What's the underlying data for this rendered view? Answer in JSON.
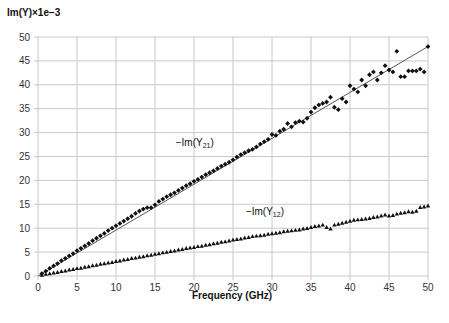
{
  "chart_data": {
    "type": "scatter",
    "title": "",
    "ylabel": "Im(Y)×1e−3",
    "xlabel": "Frequency (GHz)",
    "xlim": [
      0,
      50
    ],
    "ylim": [
      0,
      50
    ],
    "xticks": [
      0,
      5,
      10,
      15,
      20,
      25,
      30,
      35,
      40,
      45,
      50
    ],
    "yticks": [
      0,
      5,
      10,
      15,
      20,
      25,
      30,
      35,
      40,
      45,
      50
    ],
    "grid": true,
    "legend": "none",
    "series": [
      {
        "name": "−Im(Y21)",
        "label_main": "−Im(Y",
        "label_sub": "21",
        "label_close": ")",
        "marker": "diamond",
        "color": "#111111",
        "x": [
          0.5,
          1,
          1.5,
          2,
          2.5,
          3,
          3.5,
          4,
          4.5,
          5,
          5.5,
          6,
          6.5,
          7,
          7.5,
          8,
          8.5,
          9,
          9.5,
          10,
          10.5,
          11,
          11.5,
          12,
          12.5,
          13,
          13.5,
          14,
          14.5,
          15,
          15.5,
          16,
          16.5,
          17,
          17.5,
          18,
          18.5,
          19,
          19.5,
          20,
          20.5,
          21,
          21.5,
          22,
          22.5,
          23,
          23.5,
          24,
          24.5,
          25,
          25.5,
          26,
          26.5,
          27,
          27.5,
          28,
          28.5,
          29,
          29.5,
          30,
          30.5,
          31,
          31.5,
          32,
          32.5,
          33,
          33.5,
          34,
          34.5,
          35,
          35.5,
          36,
          36.5,
          37,
          37.5,
          38,
          38.5,
          39,
          39.5,
          40,
          40.5,
          41,
          41.5,
          42,
          42.5,
          43,
          43.5,
          44,
          44.5,
          45,
          45.5,
          46,
          46.5,
          47,
          47.5,
          48,
          48.5,
          49,
          49.5,
          50
        ],
        "y": [
          0.5,
          1.0,
          1.6,
          2.1,
          2.6,
          3.2,
          3.7,
          4.2,
          4.7,
          5.3,
          5.8,
          6.3,
          6.8,
          7.4,
          7.9,
          8.4,
          8.9,
          9.5,
          10.0,
          10.5,
          11.0,
          11.5,
          12.0,
          12.5,
          13.1,
          13.6,
          14.0,
          14.3,
          14.3,
          14.9,
          15.6,
          16.1,
          16.6,
          17.0,
          17.4,
          17.9,
          18.4,
          18.9,
          19.3,
          19.8,
          20.2,
          20.7,
          21.2,
          21.6,
          22.0,
          22.5,
          23.0,
          23.4,
          23.8,
          24.3,
          24.9,
          25.4,
          25.8,
          26.2,
          26.5,
          27.0,
          27.6,
          28.1,
          28.6,
          29.6,
          29.4,
          30.3,
          30.7,
          31.9,
          31.2,
          32.1,
          32.4,
          32.2,
          33.0,
          34.3,
          35.2,
          35.8,
          36.1,
          36.4,
          37.4,
          35.3,
          34.8,
          37.1,
          36.4,
          39.8,
          39.1,
          38.5,
          41.0,
          39.8,
          42.1,
          42.7,
          41.0,
          42.5,
          44.0,
          43.1,
          42.7,
          47.0,
          41.7,
          41.7,
          42.9,
          42.9,
          42.9,
          43.3,
          42.7,
          48.0
        ]
      },
      {
        "name": "−Im(Y12)",
        "label_main": "−Im(Y",
        "label_sub": "12",
        "label_close": ")",
        "marker": "triangle",
        "color": "#111111",
        "x": [
          0.5,
          1,
          1.5,
          2,
          2.5,
          3,
          3.5,
          4,
          4.5,
          5,
          5.5,
          6,
          6.5,
          7,
          7.5,
          8,
          8.5,
          9,
          9.5,
          10,
          10.5,
          11,
          11.5,
          12,
          12.5,
          13,
          13.5,
          14,
          14.5,
          15,
          15.5,
          16,
          16.5,
          17,
          17.5,
          18,
          18.5,
          19,
          19.5,
          20,
          20.5,
          21,
          21.5,
          22,
          22.5,
          23,
          23.5,
          24,
          24.5,
          25,
          25.5,
          26,
          26.5,
          27,
          27.5,
          28,
          28.5,
          29,
          29.5,
          30,
          30.5,
          31,
          31.5,
          32,
          32.5,
          33,
          33.5,
          34,
          34.5,
          35,
          35.5,
          36,
          36.5,
          37,
          37.5,
          38,
          38.5,
          39,
          39.5,
          40,
          40.5,
          41,
          41.5,
          42,
          42.5,
          43,
          43.5,
          44,
          44.5,
          45,
          45.5,
          46,
          46.5,
          47,
          47.5,
          48,
          48.5,
          49,
          49.5,
          50
        ],
        "y": [
          0.2,
          0.4,
          0.5,
          0.7,
          0.8,
          1.0,
          1.1,
          1.3,
          1.4,
          1.6,
          1.7,
          1.9,
          2.0,
          2.2,
          2.3,
          2.5,
          2.6,
          2.8,
          2.9,
          3.1,
          3.2,
          3.4,
          3.5,
          3.7,
          3.8,
          4.0,
          4.1,
          4.3,
          4.4,
          4.6,
          4.7,
          4.9,
          5.0,
          5.2,
          5.3,
          5.5,
          5.6,
          5.8,
          5.9,
          6.0,
          6.2,
          6.3,
          6.5,
          6.6,
          6.8,
          6.9,
          7.1,
          7.2,
          7.4,
          7.6,
          7.7,
          7.8,
          8.0,
          8.1,
          8.3,
          8.4,
          8.5,
          8.6,
          8.8,
          8.9,
          9.0,
          9.1,
          9.3,
          9.4,
          9.5,
          9.6,
          9.7,
          9.9,
          10.0,
          10.2,
          10.4,
          10.5,
          10.7,
          10.2,
          9.9,
          10.7,
          10.9,
          11.1,
          11.3,
          11.5,
          11.7,
          11.8,
          11.9,
          12.0,
          12.1,
          12.3,
          12.4,
          12.6,
          12.8,
          12.6,
          12.7,
          13.0,
          13.2,
          13.3,
          13.5,
          13.4,
          13.6,
          14.4,
          14.5,
          14.7
        ]
      }
    ],
    "fit_lines": [
      {
        "name": "Y21 linear fit",
        "x": [
          0,
          50
        ],
        "y": [
          0,
          48.0
        ],
        "color": "#555555"
      }
    ],
    "annotations": [
      {
        "series": 0,
        "at": [
          21.5,
          27.0
        ]
      },
      {
        "series": 1,
        "at": [
          30.5,
          12.5
        ]
      }
    ]
  }
}
